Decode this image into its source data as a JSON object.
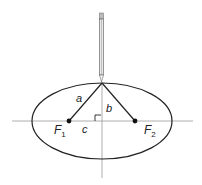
{
  "diagram": {
    "labels": {
      "a": "a",
      "b": "b",
      "c": "c",
      "f1": "F",
      "f1_sub": "1",
      "f2": "F",
      "f2_sub": "2"
    },
    "elements": [
      "ellipse",
      "major-axis",
      "minor-axis",
      "focus-1",
      "focus-2",
      "string-a",
      "string-right",
      "pencil",
      "right-angle-marker"
    ],
    "colors": {
      "stroke": "#222222",
      "axis": "#9a9a9a",
      "pencil": "#d8d8d8"
    }
  }
}
